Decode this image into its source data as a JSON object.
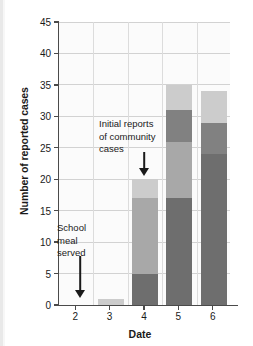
{
  "chart_data": {
    "type": "bar",
    "stacked": true,
    "title": "",
    "xlabel": "Date",
    "ylabel": "Number of reported cases",
    "categories": [
      "2",
      "3",
      "4",
      "5",
      "6"
    ],
    "ylim": [
      0,
      45
    ],
    "ytick_labels": [
      "0",
      "5",
      "10",
      "15",
      "20",
      "25",
      "30",
      "35",
      "40",
      "45"
    ],
    "ytick_values": [
      0,
      5,
      10,
      15,
      20,
      25,
      30,
      35,
      40,
      45
    ],
    "grid": true,
    "legend": "none",
    "series": [
      {
        "name": "dark-gray-segment",
        "color": "#6e6e6e",
        "values": [
          0,
          0,
          5,
          17,
          24
        ]
      },
      {
        "name": "medium-gray-segment",
        "color": "#a8a8a8",
        "values": [
          0,
          0,
          12,
          9,
          0
        ]
      },
      {
        "name": "mid-dark-gray-segment",
        "color": "#818181",
        "values": [
          0,
          0,
          0,
          5,
          5
        ]
      },
      {
        "name": "light-gray-segment",
        "color": "#cccccc",
        "values": [
          0,
          1,
          3,
          4,
          5
        ]
      }
    ],
    "totals": [
      0,
      1,
      20,
      35,
      34
    ],
    "annotations": [
      {
        "name": "school-meal-served",
        "text": "School\nmeal\nserved",
        "points_to_category": "2",
        "arrow": "down"
      },
      {
        "name": "initial-community-cases",
        "text": "Initial reports\nof community\ncases",
        "points_to_category": "4",
        "arrow": "down"
      }
    ]
  },
  "colors": {
    "axis": "#4a4a4a",
    "grid": "#d2d2d2",
    "text": "#1a1a1a",
    "plot_background": "#fbfbfb",
    "page_background": "#ffffff"
  }
}
